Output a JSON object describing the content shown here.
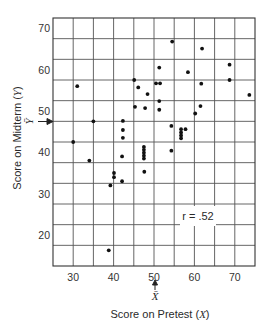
{
  "chart_data": {
    "type": "scatter",
    "title": "",
    "xlabel": "Score on Pretest (X)",
    "ylabel": "Score on Midterm (Y)",
    "xlim": [
      25,
      75
    ],
    "ylim": [
      12.5,
      72.5
    ],
    "x_ticks": [
      30,
      40,
      50,
      60,
      70
    ],
    "y_ticks": [
      20,
      30,
      40,
      50,
      60,
      70
    ],
    "grid": true,
    "grid_x_step": 5,
    "grid_y_lines": [
      17.5,
      22.5,
      27.5,
      32.5,
      37.5,
      42.5,
      47.5,
      52.5,
      57.5,
      62.5,
      67.5
    ],
    "annotation": "r = .52",
    "mean_x": 50,
    "mean_x_label": "X̄",
    "mean_y": 47.5,
    "mean_y_label": "Ȳ",
    "points": [
      {
        "x": 31,
        "y": 56
      },
      {
        "x": 35,
        "y": 47.5
      },
      {
        "x": 30,
        "y": 42.5
      },
      {
        "x": 34,
        "y": 38
      },
      {
        "x": 42.3,
        "y": 47.6
      },
      {
        "x": 42.3,
        "y": 45.4
      },
      {
        "x": 42.3,
        "y": 43.5
      },
      {
        "x": 42.1,
        "y": 39
      },
      {
        "x": 42.1,
        "y": 33
      },
      {
        "x": 40.1,
        "y": 35
      },
      {
        "x": 40.1,
        "y": 34
      },
      {
        "x": 39.2,
        "y": 32
      },
      {
        "x": 38.8,
        "y": 16.3
      },
      {
        "x": 45.1,
        "y": 57.5
      },
      {
        "x": 45.3,
        "y": 51
      },
      {
        "x": 46.1,
        "y": 55.7
      },
      {
        "x": 47.8,
        "y": 50.7
      },
      {
        "x": 48.4,
        "y": 54.1
      },
      {
        "x": 47.5,
        "y": 41.3
      },
      {
        "x": 47.5,
        "y": 40.6
      },
      {
        "x": 47.5,
        "y": 39.9
      },
      {
        "x": 47.5,
        "y": 39.2
      },
      {
        "x": 47.5,
        "y": 38.5
      },
      {
        "x": 47.6,
        "y": 35.3
      },
      {
        "x": 50.5,
        "y": 56.7
      },
      {
        "x": 51.5,
        "y": 56.7
      },
      {
        "x": 51.3,
        "y": 60.5
      },
      {
        "x": 51.3,
        "y": 52.4
      },
      {
        "x": 51.3,
        "y": 50.3
      },
      {
        "x": 54.5,
        "y": 66.8
      },
      {
        "x": 54.3,
        "y": 46.4
      },
      {
        "x": 54.3,
        "y": 40.4
      },
      {
        "x": 56.7,
        "y": 45.6
      },
      {
        "x": 57.8,
        "y": 45.6
      },
      {
        "x": 56.7,
        "y": 44.8
      },
      {
        "x": 56.7,
        "y": 44.1
      },
      {
        "x": 56.7,
        "y": 43.4
      },
      {
        "x": 58.4,
        "y": 59.4
      },
      {
        "x": 60.2,
        "y": 49.4
      },
      {
        "x": 61.5,
        "y": 51.2
      },
      {
        "x": 61.7,
        "y": 56.6
      },
      {
        "x": 61.9,
        "y": 65.1
      },
      {
        "x": 68.7,
        "y": 61.2
      },
      {
        "x": 68.7,
        "y": 57.5
      },
      {
        "x": 73.6,
        "y": 53.9
      }
    ]
  },
  "labels": {
    "xlabel_prefix": "Score on Pretest (",
    "xlabel_var": "X",
    "xlabel_suffix": ")",
    "ylabel_prefix": "Score on Midterm (",
    "ylabel_var": "Y",
    "ylabel_suffix": ")",
    "r_text": "r = .52",
    "mean_x_label": "X̄",
    "mean_y_label": "Ȳ"
  }
}
